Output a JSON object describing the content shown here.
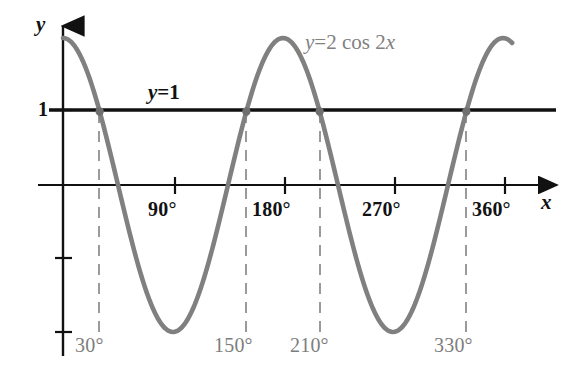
{
  "chart_data": {
    "type": "line",
    "title": "",
    "xlabel": "x",
    "ylabel": "y",
    "xlim": [
      0,
      375
    ],
    "ylim": [
      -2.35,
      2.35
    ],
    "x_unit": "degrees",
    "grid": false,
    "legend": "inline-annotations",
    "series": [
      {
        "name": "y = 2 cos 2x",
        "expression": "2*cos(2x)",
        "color": "#808080",
        "style": "solid",
        "amplitude": 2,
        "period_degrees": 180,
        "x": [
          0,
          15,
          30,
          45,
          60,
          75,
          90,
          105,
          120,
          135,
          150,
          165,
          180,
          195,
          210,
          225,
          240,
          255,
          270,
          285,
          300,
          315,
          330,
          345,
          360,
          368
        ],
        "values": [
          2,
          1.732,
          1,
          0,
          -1,
          -1.732,
          -2,
          -1.732,
          -1,
          0,
          1,
          1.732,
          2,
          1.732,
          1,
          0,
          -1,
          -1.732,
          -2,
          -1.732,
          -1,
          0,
          1,
          1.732,
          2,
          1.93
        ]
      },
      {
        "name": "y = 1",
        "expression": "1",
        "color": "#111111",
        "style": "solid",
        "x": [
          0,
          360
        ],
        "values": [
          1,
          1
        ]
      }
    ],
    "intersections": [
      {
        "x": 30,
        "y": 1,
        "label": "30°"
      },
      {
        "x": 150,
        "y": 1,
        "label": "150°"
      },
      {
        "x": 210,
        "y": 1,
        "label": "210°"
      },
      {
        "x": 330,
        "y": 1,
        "label": "330°"
      }
    ],
    "x_ticks": [
      {
        "value": 90,
        "label": "90°"
      },
      {
        "value": 180,
        "label": "180°"
      },
      {
        "value": 270,
        "label": "270°"
      },
      {
        "value": 360,
        "label": "360°"
      }
    ],
    "y_ticks": [
      {
        "value": 2,
        "label": ""
      },
      {
        "value": 1,
        "label": "1"
      },
      {
        "value": -1,
        "label": ""
      },
      {
        "value": -2,
        "label": ""
      }
    ],
    "annotations": [
      {
        "text": "y = 2 cos 2x",
        "color": "#818181",
        "at_x": 215,
        "at_y": 1.85
      },
      {
        "text": "y = 1",
        "color": "#111111",
        "at_x": 75,
        "at_y": 1.35
      }
    ]
  },
  "axes": {
    "y_axis_label": "y",
    "x_axis_label": "x",
    "y_one_label": "1"
  },
  "curve_equation": {
    "prefix": "y",
    "equals": "=",
    "body": "2 cos 2",
    "variable": "x",
    "full": "y = 2 cos 2x"
  },
  "line_equation": {
    "prefix": "y",
    "equals": "=",
    "value": "1",
    "full": "y = 1"
  },
  "x_tick_labels": [
    "90°",
    "180°",
    "270°",
    "360°"
  ],
  "solution_labels": [
    "30°",
    "150°",
    "210°",
    "330°"
  ],
  "colors": {
    "curve": "#808080",
    "line": "#111111",
    "axis": "#111111",
    "dashed": "#9a9a9a",
    "solution_text": "#7d7d7d",
    "background": "#ffffff"
  }
}
